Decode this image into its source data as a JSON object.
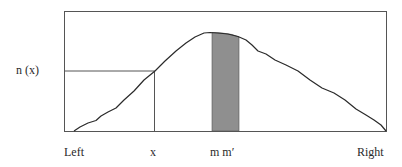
{
  "diagram": {
    "y_label": "n (x)",
    "x_labels": {
      "left": "Left",
      "x": "x",
      "m": "m m′",
      "right": "Right"
    },
    "colors": {
      "line": "#2a2a2a",
      "frame": "#555555",
      "shaded": "#8f8f8f"
    }
  }
}
